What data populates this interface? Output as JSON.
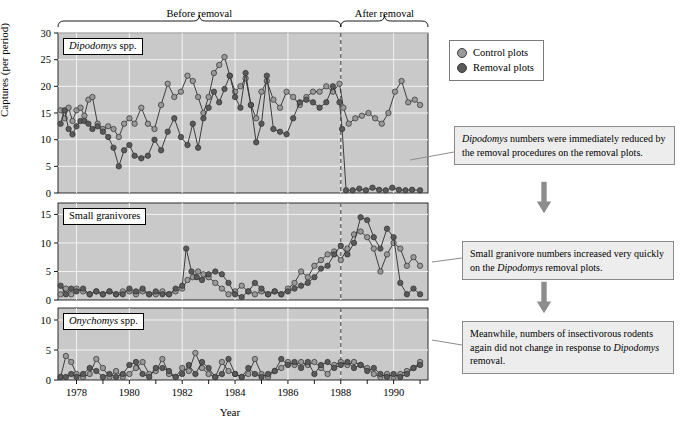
{
  "figure": {
    "ylabel": "Captures (per period)",
    "xlabel": "Year",
    "phase_before": "Before removal",
    "phase_after": "After removal",
    "removal_year": 1988
  },
  "legend": {
    "items": [
      {
        "label": "Control plots",
        "color": "#9a9a9a",
        "icon": "circle-marker-icon"
      },
      {
        "label": "Removal plots",
        "color": "#5a5a5a",
        "icon": "circle-marker-icon"
      }
    ]
  },
  "callouts": [
    {
      "id": "callout-dipodomys",
      "text_parts": [
        {
          "t": "Dipodomys",
          "i": true
        },
        {
          "t": " numbers were immediately reduced by the removal procedures on the removal plots.",
          "i": false
        }
      ]
    },
    {
      "id": "callout-granivores",
      "text_parts": [
        {
          "t": "Small granivore numbers increased very quickly on the ",
          "i": false
        },
        {
          "t": "Dipodomys",
          "i": true
        },
        {
          "t": " removal plots.",
          "i": false
        }
      ]
    },
    {
      "id": "callout-onychomys",
      "text_parts": [
        {
          "t": "Meanwhile, numbers of insectivorous rodents again did not change in response to ",
          "i": false
        },
        {
          "t": "Dipodomys",
          "i": true
        },
        {
          "t": " removal.",
          "i": false
        }
      ]
    }
  ],
  "chart_data": [
    {
      "type": "line",
      "panel": "dipodomys",
      "title_parts": [
        {
          "t": "Dipodomys",
          "i": true
        },
        {
          "t": " spp.",
          "i": false
        }
      ],
      "xlabel": "Year",
      "ylabel": "Captures (per period)",
      "xlim": [
        1977.3,
        1991.3
      ],
      "ylim": [
        0,
        30
      ],
      "yticks": [
        0,
        5,
        10,
        15,
        20,
        25,
        30
      ],
      "xticks": [
        1978,
        1980,
        1982,
        1984,
        1986,
        1988,
        1990
      ],
      "grid": true,
      "legend_position": "outside-right-top",
      "series": [
        {
          "name": "Control plots",
          "color": "#9a9a9a",
          "x": [
            1977.4,
            1977.55,
            1977.7,
            1977.85,
            1978.0,
            1978.15,
            1978.3,
            1978.45,
            1978.6,
            1978.8,
            1979.0,
            1979.2,
            1979.4,
            1979.6,
            1979.8,
            1980.0,
            1980.2,
            1980.45,
            1980.7,
            1980.95,
            1981.2,
            1981.45,
            1981.7,
            1981.95,
            1982.2,
            1982.4,
            1982.6,
            1982.8,
            1983.0,
            1983.2,
            1983.4,
            1983.6,
            1983.8,
            1984.0,
            1984.2,
            1984.4,
            1984.6,
            1984.8,
            1985.0,
            1985.2,
            1985.45,
            1985.7,
            1985.95,
            1986.2,
            1986.45,
            1986.7,
            1986.95,
            1987.2,
            1987.45,
            1987.7,
            1987.95,
            1988.1,
            1988.3,
            1988.55,
            1988.8,
            1989.05,
            1989.3,
            1989.55,
            1989.8,
            1990.05,
            1990.3,
            1990.55,
            1990.8,
            1991.0
          ],
          "y": [
            15.5,
            14.0,
            16.0,
            13.5,
            15.5,
            16.0,
            14.5,
            17.5,
            18.0,
            13.0,
            12.0,
            12.5,
            12.0,
            10.5,
            13.0,
            14.0,
            13.0,
            16.0,
            13.0,
            12.0,
            16.5,
            20.5,
            18.0,
            19.0,
            22.0,
            21.0,
            18.0,
            15.0,
            18.0,
            22.5,
            24.0,
            25.5,
            22.0,
            19.0,
            20.0,
            21.5,
            16.5,
            14.0,
            19.0,
            21.0,
            17.5,
            16.0,
            19.0,
            18.0,
            16.5,
            18.0,
            19.0,
            19.0,
            20.0,
            19.0,
            20.5,
            16.0,
            13.0,
            14.0,
            14.5,
            15.0,
            14.0,
            13.0,
            15.0,
            19.0,
            21.0,
            17.0,
            17.5,
            16.5
          ]
        },
        {
          "name": "Removal plots",
          "color": "#5a5a5a",
          "x": [
            1977.4,
            1977.55,
            1977.7,
            1977.85,
            1978.0,
            1978.15,
            1978.3,
            1978.45,
            1978.6,
            1978.8,
            1979.0,
            1979.2,
            1979.4,
            1979.6,
            1979.8,
            1980.0,
            1980.2,
            1980.45,
            1980.7,
            1980.95,
            1981.2,
            1981.45,
            1981.7,
            1981.95,
            1982.2,
            1982.4,
            1982.6,
            1982.8,
            1983.0,
            1983.2,
            1983.4,
            1983.6,
            1983.8,
            1984.0,
            1984.2,
            1984.4,
            1984.6,
            1984.8,
            1985.0,
            1985.2,
            1985.45,
            1985.7,
            1985.95,
            1986.2,
            1986.45,
            1986.7,
            1986.95,
            1987.2,
            1987.45,
            1987.7,
            1987.95,
            1988.05,
            1988.2,
            1988.45,
            1988.7,
            1988.95,
            1989.2,
            1989.45,
            1989.7,
            1989.95,
            1990.2,
            1990.45,
            1990.7,
            1991.0
          ],
          "y": [
            13.0,
            15.5,
            12.0,
            11.0,
            12.5,
            13.5,
            13.5,
            13.0,
            12.0,
            12.5,
            11.5,
            10.5,
            8.5,
            5.0,
            8.0,
            9.0,
            7.0,
            6.5,
            7.0,
            10.0,
            8.0,
            11.5,
            14.0,
            10.5,
            9.0,
            13.0,
            8.5,
            14.0,
            16.0,
            19.0,
            17.0,
            19.5,
            22.0,
            18.0,
            16.0,
            22.5,
            16.5,
            9.5,
            13.0,
            22.0,
            12.0,
            11.5,
            11.0,
            14.0,
            17.0,
            17.5,
            17.0,
            16.0,
            17.0,
            20.0,
            17.0,
            12.0,
            0.5,
            0.5,
            0.8,
            0.5,
            1.0,
            0.6,
            0.5,
            1.0,
            0.6,
            0.5,
            0.6,
            0.5
          ]
        }
      ]
    },
    {
      "type": "line",
      "panel": "small_granivores",
      "title_parts": [
        {
          "t": "Small granivores",
          "i": false
        }
      ],
      "xlabel": "Year",
      "ylabel": "Captures (per period)",
      "xlim": [
        1977.3,
        1991.3
      ],
      "ylim": [
        0,
        17
      ],
      "yticks": [
        0,
        5,
        10,
        15
      ],
      "xticks": [
        1978,
        1980,
        1982,
        1984,
        1986,
        1988,
        1990
      ],
      "grid": true,
      "series": [
        {
          "name": "Control plots",
          "color": "#9a9a9a",
          "x": [
            1977.4,
            1977.6,
            1977.8,
            1978.0,
            1978.25,
            1978.5,
            1978.75,
            1979.0,
            1979.25,
            1979.5,
            1979.75,
            1980.0,
            1980.25,
            1980.5,
            1980.75,
            1981.0,
            1981.25,
            1981.5,
            1981.75,
            1982.0,
            1982.2,
            1982.4,
            1982.6,
            1982.8,
            1983.0,
            1983.25,
            1983.5,
            1983.75,
            1984.0,
            1984.25,
            1984.5,
            1984.75,
            1985.0,
            1985.25,
            1985.5,
            1985.75,
            1986.0,
            1986.25,
            1986.5,
            1986.75,
            1987.0,
            1987.25,
            1987.5,
            1987.75,
            1988.0,
            1988.25,
            1988.5,
            1988.75,
            1989.0,
            1989.25,
            1989.5,
            1989.75,
            1990.0,
            1990.25,
            1990.5,
            1990.75,
            1991.0
          ],
          "y": [
            1.0,
            2.0,
            1.0,
            2.0,
            1.5,
            1.0,
            1.5,
            1.0,
            1.5,
            1.0,
            1.5,
            1.5,
            1.0,
            1.5,
            1.0,
            1.0,
            1.5,
            1.0,
            1.5,
            2.0,
            3.5,
            4.0,
            5.0,
            4.5,
            4.0,
            3.0,
            2.0,
            1.0,
            1.5,
            2.5,
            1.5,
            1.0,
            1.5,
            1.0,
            1.5,
            1.0,
            2.0,
            3.0,
            5.0,
            4.0,
            6.0,
            7.0,
            8.0,
            8.5,
            7.0,
            9.0,
            11.5,
            12.0,
            11.0,
            9.0,
            5.0,
            8.0,
            10.0,
            9.0,
            6.0,
            7.5,
            6.0
          ]
        },
        {
          "name": "Removal plots",
          "color": "#5a5a5a",
          "x": [
            1977.4,
            1977.6,
            1977.8,
            1978.0,
            1978.25,
            1978.5,
            1978.75,
            1979.0,
            1979.25,
            1979.5,
            1979.75,
            1980.0,
            1980.25,
            1980.5,
            1980.75,
            1981.0,
            1981.25,
            1981.5,
            1981.75,
            1982.0,
            1982.15,
            1982.35,
            1982.55,
            1982.75,
            1983.0,
            1983.25,
            1983.5,
            1983.75,
            1984.0,
            1984.25,
            1984.5,
            1984.75,
            1985.0,
            1985.25,
            1985.5,
            1985.75,
            1986.0,
            1986.25,
            1986.5,
            1986.75,
            1987.0,
            1987.25,
            1987.5,
            1987.75,
            1988.0,
            1988.25,
            1988.5,
            1988.75,
            1989.0,
            1989.25,
            1989.5,
            1989.75,
            1990.0,
            1990.25,
            1990.5,
            1990.75,
            1991.0
          ],
          "y": [
            2.5,
            1.0,
            2.0,
            1.5,
            2.0,
            1.0,
            1.5,
            1.0,
            1.5,
            1.0,
            1.0,
            2.0,
            1.5,
            2.0,
            1.0,
            1.5,
            1.0,
            1.0,
            2.0,
            2.5,
            9.0,
            5.0,
            4.0,
            3.5,
            4.5,
            5.0,
            4.5,
            3.0,
            1.0,
            0.5,
            1.5,
            3.0,
            2.0,
            1.0,
            1.5,
            1.0,
            1.5,
            2.0,
            2.5,
            3.0,
            4.0,
            5.5,
            6.0,
            8.0,
            9.5,
            8.0,
            10.0,
            14.5,
            14.0,
            11.0,
            9.0,
            12.5,
            11.0,
            3.0,
            1.0,
            2.0,
            1.0
          ]
        }
      ]
    },
    {
      "type": "line",
      "panel": "onychomys",
      "title_parts": [
        {
          "t": "Onychomys",
          "i": true
        },
        {
          "t": " spp.",
          "i": false
        }
      ],
      "xlabel": "Year",
      "ylabel": "Captures (per period)",
      "xlim": [
        1977.3,
        1991.3
      ],
      "ylim": [
        0,
        12
      ],
      "yticks": [
        0,
        5,
        10
      ],
      "xticks": [
        1978,
        1980,
        1982,
        1984,
        1986,
        1988,
        1990
      ],
      "grid": true,
      "series": [
        {
          "name": "Control plots",
          "color": "#9a9a9a",
          "x": [
            1977.4,
            1977.6,
            1977.8,
            1978.0,
            1978.25,
            1978.5,
            1978.75,
            1979.0,
            1979.25,
            1979.5,
            1979.75,
            1980.0,
            1980.25,
            1980.5,
            1980.75,
            1981.0,
            1981.25,
            1981.5,
            1981.75,
            1982.0,
            1982.25,
            1982.5,
            1982.75,
            1983.0,
            1983.25,
            1983.5,
            1983.75,
            1984.0,
            1984.25,
            1984.5,
            1984.75,
            1985.0,
            1985.25,
            1985.5,
            1985.75,
            1986.0,
            1986.25,
            1986.5,
            1986.75,
            1987.0,
            1987.25,
            1987.5,
            1987.75,
            1988.0,
            1988.25,
            1988.5,
            1988.75,
            1989.0,
            1989.25,
            1989.5,
            1989.75,
            1990.0,
            1990.25,
            1990.5,
            1990.75,
            1991.0
          ],
          "y": [
            0.5,
            4.0,
            3.0,
            1.0,
            0.5,
            1.0,
            3.5,
            2.0,
            0.5,
            1.5,
            0.5,
            1.0,
            2.0,
            3.0,
            1.0,
            1.5,
            3.5,
            1.0,
            0.5,
            2.0,
            1.5,
            4.5,
            2.0,
            1.0,
            0.5,
            3.0,
            1.5,
            1.0,
            0.5,
            1.0,
            3.5,
            1.0,
            0.5,
            1.5,
            2.0,
            3.0,
            2.5,
            3.0,
            2.5,
            3.0,
            2.0,
            1.0,
            2.5,
            3.0,
            2.5,
            3.0,
            2.5,
            2.0,
            1.0,
            0.5,
            1.0,
            0.5,
            1.0,
            1.5,
            2.0,
            3.0
          ]
        },
        {
          "name": "Removal plots",
          "color": "#5a5a5a",
          "x": [
            1977.4,
            1977.6,
            1977.8,
            1978.0,
            1978.25,
            1978.5,
            1978.75,
            1979.0,
            1979.25,
            1979.5,
            1979.75,
            1980.0,
            1980.25,
            1980.5,
            1980.75,
            1981.0,
            1981.25,
            1981.5,
            1981.75,
            1982.0,
            1982.25,
            1982.5,
            1982.75,
            1983.0,
            1983.25,
            1983.5,
            1983.75,
            1984.0,
            1984.25,
            1984.5,
            1984.75,
            1985.0,
            1985.25,
            1985.5,
            1985.75,
            1986.0,
            1986.25,
            1986.5,
            1986.75,
            1987.0,
            1987.25,
            1987.5,
            1987.75,
            1988.0,
            1988.25,
            1988.5,
            1988.75,
            1989.0,
            1989.25,
            1989.5,
            1989.75,
            1990.0,
            1990.25,
            1990.5,
            1990.75,
            1991.0
          ],
          "y": [
            0.5,
            0.5,
            1.0,
            0.5,
            1.0,
            2.0,
            1.5,
            0.5,
            1.0,
            0.5,
            1.0,
            2.5,
            3.0,
            1.0,
            0.5,
            2.0,
            2.0,
            1.5,
            0.5,
            1.0,
            2.5,
            1.0,
            3.0,
            2.0,
            0.5,
            1.0,
            3.5,
            1.0,
            0.5,
            2.0,
            1.0,
            0.5,
            1.0,
            1.5,
            3.5,
            2.5,
            3.0,
            2.0,
            3.0,
            1.0,
            2.5,
            3.0,
            2.0,
            2.5,
            3.0,
            2.0,
            2.5,
            1.5,
            2.0,
            1.0,
            0.5,
            1.0,
            0.5,
            1.0,
            2.0,
            2.5
          ]
        }
      ]
    }
  ]
}
